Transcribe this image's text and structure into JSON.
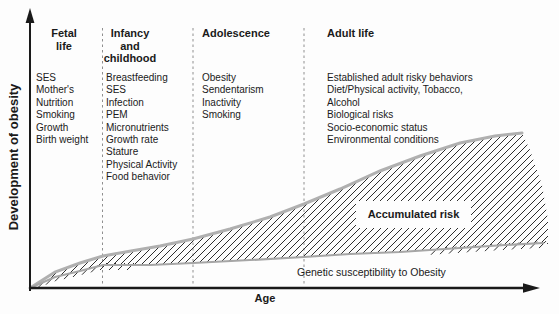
{
  "figure": {
    "y_axis_label": "Development of obesity",
    "x_axis_label": "Age"
  },
  "stages": [
    {
      "id": "fetal",
      "title_lines": [
        "Fetal",
        "life"
      ],
      "items": [
        "SES",
        "Mother's",
        "Nutrition",
        "Smoking",
        "Growth",
        "Birth weight"
      ]
    },
    {
      "id": "infancy",
      "title_lines": [
        "Infancy",
        "and",
        "childhood"
      ],
      "items": [
        "Breastfeeding",
        "SES",
        "Infection",
        "PEM",
        "Micronutrients",
        "Growth rate",
        "Stature",
        "Physical Activity",
        "Food behavior"
      ]
    },
    {
      "id": "adolescence",
      "title_lines": [
        "Adolescence"
      ],
      "items": [
        "Obesity",
        "Sendentarism",
        "Inactivity",
        "Smoking"
      ]
    },
    {
      "id": "adult",
      "title_lines": [
        "Adult life"
      ],
      "items": [
        "Established adult risky behaviors",
        "Diet/Physical activity, Tobacco,",
        "Alcohol",
        "Biological risks",
        "Socio-economic status",
        "Environmental conditions"
      ]
    }
  ],
  "annotations": {
    "accumulated_risk": "Accumulated risk",
    "genetic_susceptibility": "Genetic susceptibility to Obesity"
  },
  "colors": {
    "upper_curve": "#b0b0b0",
    "lower_curve": "#a6a6a6",
    "hatch": "#2e2e2e",
    "dashed": "#8f8f8f",
    "axis": "#1a1a1a"
  },
  "chart_data": {
    "type": "area",
    "xlabel": "Age",
    "ylabel": "Development of obesity",
    "legend": [
      "Accumulated risk (hatched band)",
      "Genetic susceptibility to Obesity (lower curve)"
    ],
    "separators_x": [
      102.5,
      193,
      304
    ],
    "upper_curve": [
      [
        30,
        288
      ],
      [
        55,
        272
      ],
      [
        80,
        263
      ],
      [
        103,
        256
      ],
      [
        131,
        251
      ],
      [
        160,
        246
      ],
      [
        193,
        239
      ],
      [
        230,
        229
      ],
      [
        270,
        217
      ],
      [
        304,
        204
      ],
      [
        340,
        189
      ],
      [
        380,
        171
      ],
      [
        420,
        156
      ],
      [
        460,
        143
      ],
      [
        495,
        136
      ],
      [
        522,
        133
      ]
    ],
    "area_right_edge": [
      [
        530,
        150
      ],
      [
        542,
        185
      ],
      [
        548,
        220
      ],
      [
        548,
        244
      ]
    ],
    "lower_curve": [
      [
        30,
        288
      ],
      [
        55,
        277
      ],
      [
        80,
        271
      ],
      [
        103,
        265
      ],
      [
        150,
        265
      ],
      [
        193,
        263
      ],
      [
        250,
        260
      ],
      [
        304,
        257
      ],
      [
        350,
        254
      ],
      [
        400,
        252
      ],
      [
        460,
        248
      ],
      [
        505,
        245
      ],
      [
        543,
        243
      ]
    ],
    "overshoot_tick_zones": [
      [
        40,
        131
      ],
      [
        434,
        546
      ]
    ]
  }
}
